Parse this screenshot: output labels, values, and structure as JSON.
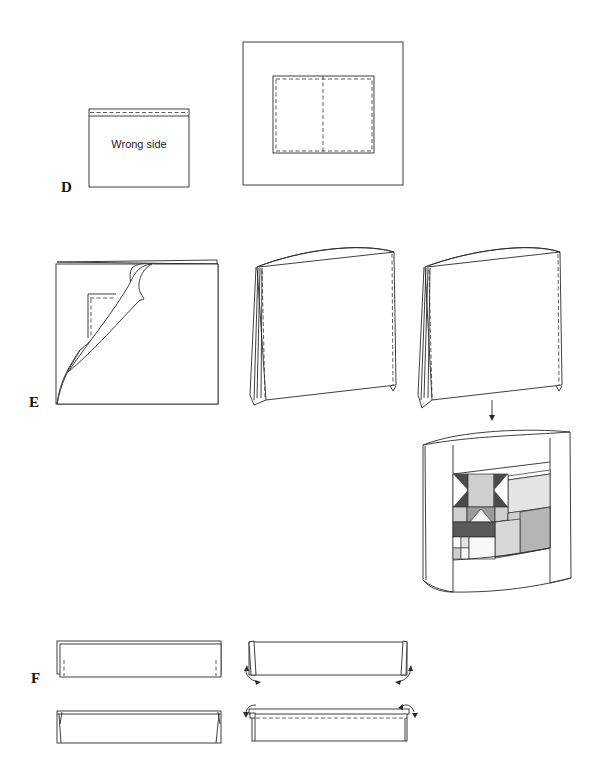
{
  "steps": {
    "d": {
      "label": "D",
      "panel_text": "Wrong side"
    },
    "e": {
      "label": "E"
    },
    "f": {
      "label": "F"
    }
  },
  "colors": {
    "line": "#2a2a2a",
    "dark": "#5a5a5a",
    "mid": "#9a9a9a",
    "light": "#cfcfcf",
    "pale": "#e4e4e4",
    "white": "#ffffff"
  }
}
